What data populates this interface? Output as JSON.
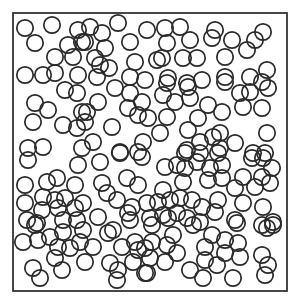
{
  "diagram": {
    "type": "particle-packing",
    "box": {
      "x": 13,
      "y": 13,
      "width": 274,
      "height": 278,
      "stroke": "#333333",
      "stroke_width": 1.8
    },
    "circle_style": {
      "radius": 8.2,
      "stroke": "#2a2a2a",
      "stroke_width": 1.7,
      "fill": "none"
    },
    "circles": [
      [
        25,
        28
      ],
      [
        52,
        25
      ],
      [
        35,
        43
      ],
      [
        68,
        45
      ],
      [
        78,
        30
      ],
      [
        82,
        42
      ],
      [
        55,
        57
      ],
      [
        73,
        57
      ],
      [
        25,
        75
      ],
      [
        43,
        75
      ],
      [
        55,
        73
      ],
      [
        78,
        75
      ],
      [
        90,
        27
      ],
      [
        102,
        33
      ],
      [
        85,
        42
      ],
      [
        118,
        23
      ],
      [
        147,
        30
      ],
      [
        130,
        42
      ],
      [
        105,
        48
      ],
      [
        95,
        58
      ],
      [
        109,
        68
      ],
      [
        100,
        65
      ],
      [
        135,
        62
      ],
      [
        157,
        60
      ],
      [
        97,
        77
      ],
      [
        130,
        77
      ],
      [
        145,
        80
      ],
      [
        165,
        28
      ],
      [
        180,
        27
      ],
      [
        167,
        43
      ],
      [
        190,
        40
      ],
      [
        215,
        30
      ],
      [
        212,
        38
      ],
      [
        162,
        58
      ],
      [
        183,
        58
      ],
      [
        197,
        58
      ],
      [
        225,
        57
      ],
      [
        168,
        78
      ],
      [
        187,
        83
      ],
      [
        202,
        80
      ],
      [
        225,
        77
      ],
      [
        232,
        40
      ],
      [
        247,
        50
      ],
      [
        255,
        40
      ],
      [
        263,
        32
      ],
      [
        250,
        77
      ],
      [
        267,
        70
      ],
      [
        262,
        82
      ],
      [
        65,
        90
      ],
      [
        77,
        93
      ],
      [
        35,
        103
      ],
      [
        48,
        110
      ],
      [
        33,
        122
      ],
      [
        63,
        125
      ],
      [
        77,
        128
      ],
      [
        82,
        112
      ],
      [
        28,
        148
      ],
      [
        43,
        147
      ],
      [
        82,
        148
      ],
      [
        115,
        88
      ],
      [
        130,
        93
      ],
      [
        142,
        102
      ],
      [
        98,
        102
      ],
      [
        87,
        112
      ],
      [
        128,
        108
      ],
      [
        138,
        115
      ],
      [
        148,
        118
      ],
      [
        112,
        127
      ],
      [
        85,
        122
      ],
      [
        93,
        142
      ],
      [
        143,
        142
      ],
      [
        120,
        152
      ],
      [
        138,
        152
      ],
      [
        167,
        83
      ],
      [
        188,
        87
      ],
      [
        163,
        95
      ],
      [
        175,
        102
      ],
      [
        190,
        98
      ],
      [
        208,
        105
      ],
      [
        222,
        112
      ],
      [
        167,
        117
      ],
      [
        198,
        118
      ],
      [
        160,
        133
      ],
      [
        188,
        130
      ],
      [
        200,
        142
      ],
      [
        213,
        137
      ],
      [
        187,
        150
      ],
      [
        225,
        82
      ],
      [
        240,
        93
      ],
      [
        250,
        92
      ],
      [
        268,
        88
      ],
      [
        243,
        107
      ],
      [
        262,
        108
      ],
      [
        267,
        133
      ],
      [
        220,
        133
      ],
      [
        235,
        143
      ],
      [
        220,
        148
      ],
      [
        253,
        153
      ],
      [
        265,
        153
      ],
      [
        28,
        160
      ],
      [
        78,
        165
      ],
      [
        25,
        185
      ],
      [
        47,
        182
      ],
      [
        57,
        178
      ],
      [
        75,
        185
      ],
      [
        25,
        203
      ],
      [
        43,
        197
      ],
      [
        55,
        200
      ],
      [
        65,
        198
      ],
      [
        42,
        210
      ],
      [
        58,
        208
      ],
      [
        75,
        208
      ],
      [
        27,
        220
      ],
      [
        37,
        223
      ],
      [
        63,
        220
      ],
      [
        77,
        220
      ],
      [
        100,
        162
      ],
      [
        120,
        153
      ],
      [
        142,
        157
      ],
      [
        102,
        183
      ],
      [
        127,
        178
      ],
      [
        138,
        185
      ],
      [
        107,
        193
      ],
      [
        117,
        200
      ],
      [
        132,
        207
      ],
      [
        147,
        203
      ],
      [
        98,
        217
      ],
      [
        128,
        213
      ],
      [
        150,
        218
      ],
      [
        83,
        203
      ],
      [
        185,
        153
      ],
      [
        200,
        153
      ],
      [
        218,
        153
      ],
      [
        165,
        167
      ],
      [
        177,
        165
      ],
      [
        185,
        168
      ],
      [
        197,
        162
      ],
      [
        210,
        168
      ],
      [
        222,
        165
      ],
      [
        208,
        180
      ],
      [
        222,
        178
      ],
      [
        183,
        182
      ],
      [
        163,
        190
      ],
      [
        158,
        202
      ],
      [
        170,
        200
      ],
      [
        180,
        198
      ],
      [
        192,
        200
      ],
      [
        202,
        207
      ],
      [
        218,
        200
      ],
      [
        163,
        215
      ],
      [
        177,
        213
      ],
      [
        187,
        218
      ],
      [
        200,
        222
      ],
      [
        215,
        212
      ],
      [
        252,
        158
      ],
      [
        263,
        158
      ],
      [
        272,
        168
      ],
      [
        262,
        177
      ],
      [
        243,
        177
      ],
      [
        270,
        183
      ],
      [
        235,
        188
      ],
      [
        255,
        187
      ],
      [
        243,
        203
      ],
      [
        263,
        207
      ],
      [
        235,
        220
      ],
      [
        273,
        222
      ],
      [
        262,
        225
      ],
      [
        35,
        225
      ],
      [
        23,
        242
      ],
      [
        38,
        240
      ],
      [
        50,
        237
      ],
      [
        63,
        232
      ],
      [
        83,
        230
      ],
      [
        58,
        247
      ],
      [
        70,
        248
      ],
      [
        80,
        242
      ],
      [
        93,
        247
      ],
      [
        113,
        230
      ],
      [
        108,
        233
      ],
      [
        122,
        247
      ],
      [
        135,
        242
      ],
      [
        138,
        250
      ],
      [
        33,
        268
      ],
      [
        40,
        278
      ],
      [
        55,
        258
      ],
      [
        62,
        270
      ],
      [
        85,
        262
      ],
      [
        110,
        263
      ],
      [
        118,
        270
      ],
      [
        117,
        280
      ],
      [
        133,
        262
      ],
      [
        145,
        273
      ],
      [
        130,
        220
      ],
      [
        152,
        225
      ],
      [
        168,
        218
      ],
      [
        193,
        225
      ],
      [
        237,
        223
      ],
      [
        267,
        228
      ],
      [
        273,
        225
      ],
      [
        152,
        242
      ],
      [
        173,
        235
      ],
      [
        167,
        245
      ],
      [
        145,
        248
      ],
      [
        177,
        253
      ],
      [
        212,
        235
      ],
      [
        225,
        240
      ],
      [
        238,
        243
      ],
      [
        205,
        247
      ],
      [
        225,
        253
      ],
      [
        150,
        258
      ],
      [
        165,
        262
      ],
      [
        205,
        260
      ],
      [
        217,
        265
      ],
      [
        240,
        257
      ],
      [
        262,
        255
      ],
      [
        268,
        265
      ],
      [
        147,
        273
      ],
      [
        190,
        270
      ],
      [
        203,
        278
      ],
      [
        233,
        278
      ],
      [
        265,
        275
      ]
    ]
  }
}
